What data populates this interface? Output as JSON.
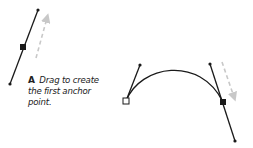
{
  "caption": {
    "letter": "A",
    "text": "Drag to create the first anchor point."
  },
  "colors": {
    "line": "#1a1a1a",
    "arrow": "#c8c8c8",
    "background": "#ffffff"
  },
  "figure_a": {
    "handle_top": [
      38,
      10
    ],
    "anchor": [
      23,
      47
    ],
    "handle_bottom": [
      10,
      84
    ],
    "anchor_style": "filled-square",
    "drag_arrow": {
      "from": [
        36,
        56
      ],
      "to": [
        48,
        16
      ],
      "style": "dashed"
    }
  },
  "figure_b": {
    "start_anchor": [
      126,
      101
    ],
    "start_anchor_style": "hollow-square",
    "start_handle": [
      140,
      65
    ],
    "end_anchor": [
      223,
      102
    ],
    "end_anchor_style": "filled-square",
    "end_handle_top": [
      210,
      64
    ],
    "end_handle_bottom": [
      235,
      141
    ],
    "drag_arrow": {
      "from": [
        222,
        62
      ],
      "to": [
        236,
        100
      ],
      "style": "dashed"
    }
  }
}
